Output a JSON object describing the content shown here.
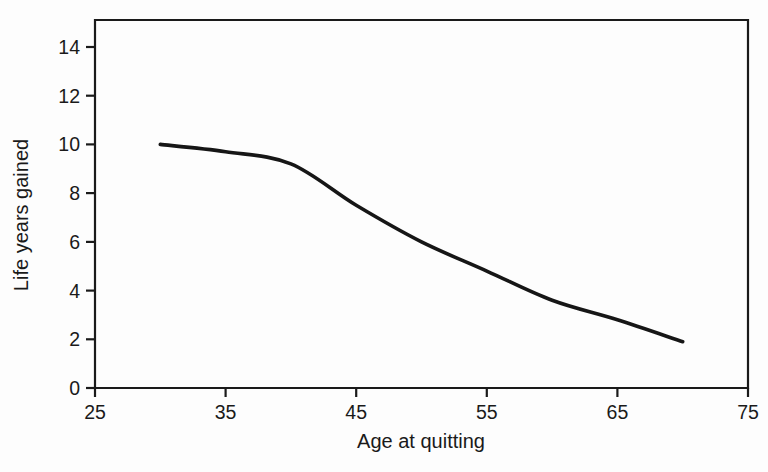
{
  "figure": {
    "background_color": "#fdfdfd",
    "axis_color": "#1a1a1a",
    "curve_color": "#161616",
    "text_color": "#1a1a1a"
  },
  "chart_data": {
    "type": "line",
    "title": "",
    "xlabel": "Age at quitting",
    "ylabel": "Life years gained",
    "xlim": [
      25,
      75
    ],
    "ylim": [
      0,
      14
    ],
    "x_ticks": [
      25,
      35,
      45,
      55,
      65,
      75
    ],
    "y_ticks": [
      0,
      2,
      4,
      6,
      8,
      10,
      12,
      14
    ],
    "grid": false,
    "legend": "none",
    "plot_border": "full-box",
    "series": [
      {
        "name": "life-years-gained",
        "color": "#161616",
        "x": [
          30,
          35,
          40,
          45,
          50,
          55,
          60,
          65,
          70
        ],
        "y": [
          10.0,
          9.7,
          9.2,
          7.5,
          6.0,
          4.8,
          3.6,
          2.8,
          1.9
        ]
      }
    ]
  }
}
